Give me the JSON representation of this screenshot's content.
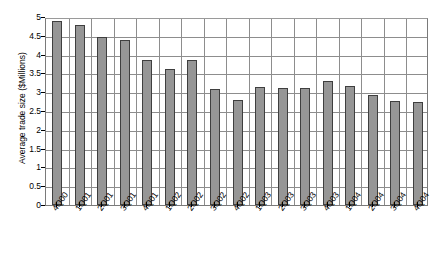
{
  "chart_data": {
    "type": "bar",
    "title": "",
    "xlabel": "",
    "ylabel": "Average trade size ($Millions)",
    "ylim": [
      0,
      5
    ],
    "ytick_step": 0.5,
    "grid": true,
    "legend": "none",
    "bar_color": "#969696",
    "bar_border_color": "#3f3f3f",
    "gridline_color": "#8d8d8d",
    "categories": [
      "4Q00",
      "1Q01",
      "2Q01",
      "3Q01",
      "4Q01",
      "1Q02",
      "2Q02",
      "3Q02",
      "4Q02",
      "1Q03",
      "2Q03",
      "3Q03",
      "4Q03",
      "1Q04",
      "2Q04",
      "3Q04",
      "4Q04"
    ],
    "values": [
      4.9,
      4.8,
      4.47,
      4.4,
      3.85,
      3.63,
      3.87,
      3.08,
      2.8,
      3.13,
      3.12,
      3.1,
      3.3,
      3.17,
      2.92,
      2.77,
      2.75
    ],
    "yticks": [
      "0",
      "0.5",
      "1",
      "1.5",
      "2",
      "2.5",
      "3",
      "3.5",
      "4",
      "4.5",
      "5"
    ],
    "ytick_values": [
      0,
      0.5,
      1,
      1.5,
      2,
      2.5,
      3,
      3.5,
      4,
      4.5,
      5
    ]
  }
}
